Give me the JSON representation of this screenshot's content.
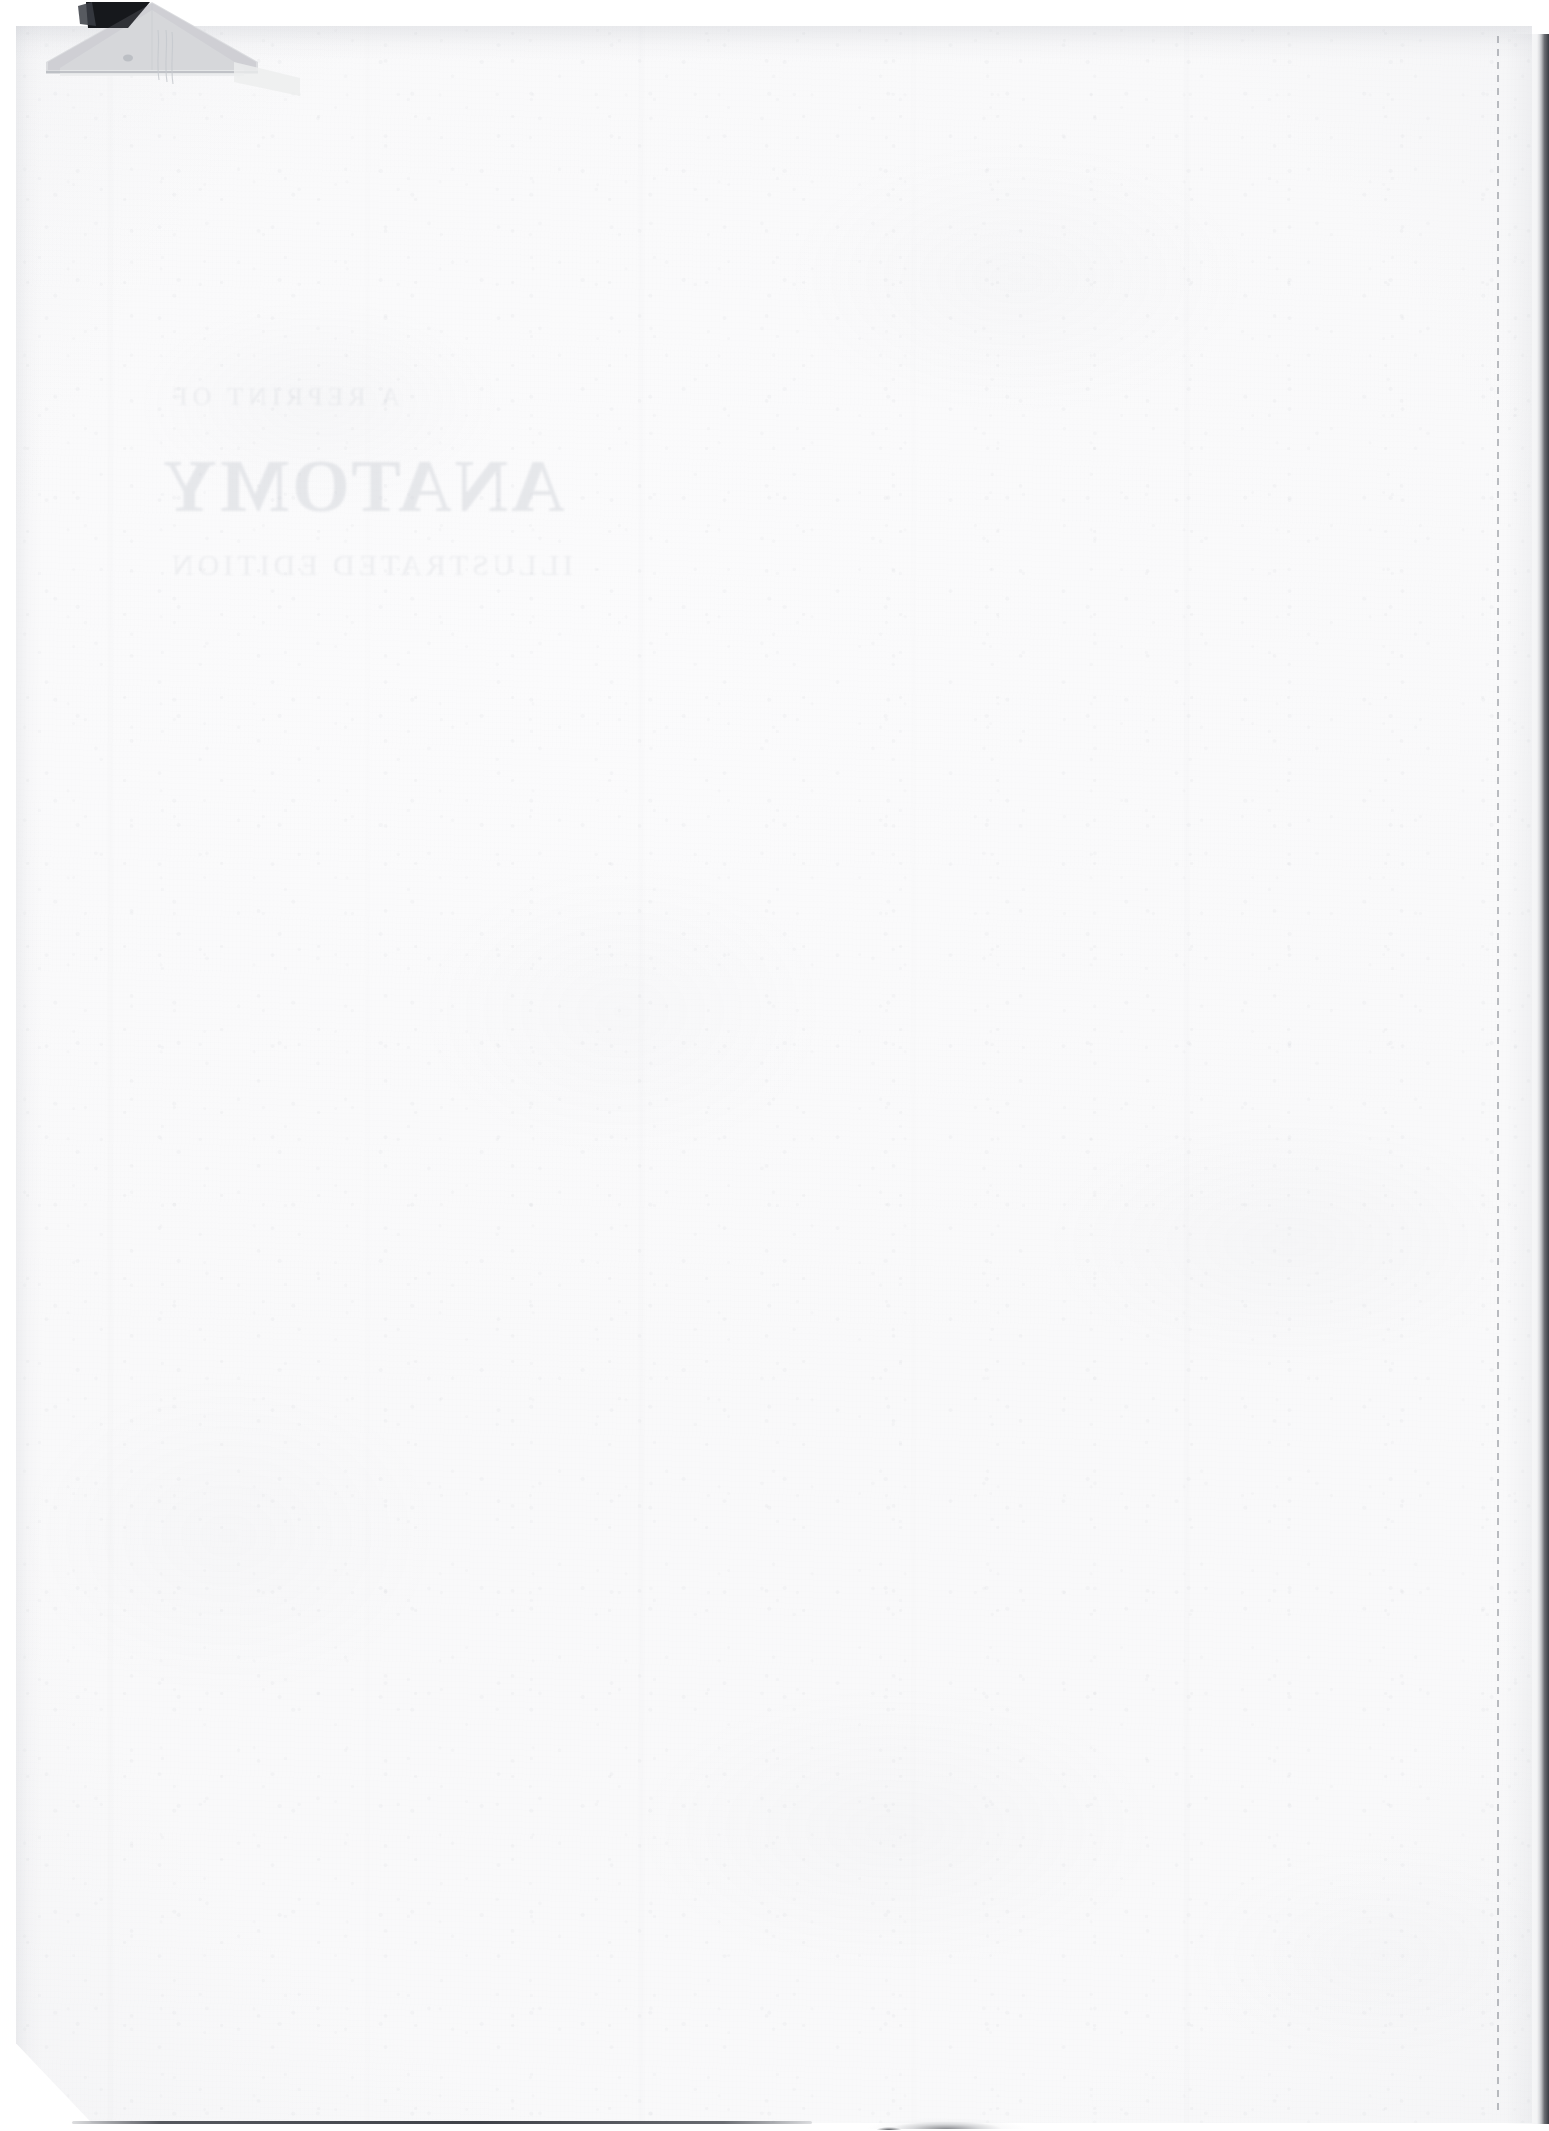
{
  "document": {
    "kind": "scanned-book-page",
    "page_state": "blank-verso",
    "page_width": 1549,
    "page_height": 2131,
    "paper_color": "#fbfbfc",
    "page_edge_shadow_color": "#2b2e35"
  },
  "artifacts": {
    "folded_corner": {
      "name": "dog-eared-top-left-corner",
      "notch_color": "#16181c",
      "flap_color": "#d9dadd",
      "crease_color": "#b9bcc2"
    },
    "dashed_rule": {
      "name": "right-margin-dashed-line",
      "color": "#80848c",
      "x": 1497
    },
    "bottom_rule": {
      "name": "bottom-edge-dark-line",
      "color": "#3a3d44"
    },
    "bottom_smudge": {
      "name": "bottom-edge-smudge",
      "color": "#3c3f46"
    }
  },
  "showthrough": {
    "note": "faint mirrored bleed-through from the printed reverse side",
    "color": "#cfd2d8",
    "pretitle": "A   REPRINT   OF",
    "title": "ANATOMY",
    "subtitle": "ILLUSTRATED  EDITION"
  }
}
